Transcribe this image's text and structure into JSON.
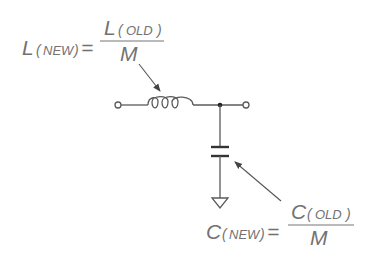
{
  "diagram": {
    "colors": {
      "background": "#ffffff",
      "text": "#727272",
      "wire": "#5a5a5a",
      "junction": "#222222"
    },
    "inductor_equation": {
      "lhs_symbol": "L",
      "lhs_subscript": "NEW",
      "equals": "=",
      "numerator_symbol": "L",
      "numerator_subscript": "OLD",
      "denominator": "M",
      "paren_open": "(",
      "paren_close": ")"
    },
    "capacitor_equation": {
      "lhs_symbol": "C",
      "lhs_subscript": "NEW",
      "equals": "=",
      "numerator_symbol": "C",
      "numerator_subscript": "OLD",
      "denominator": "M",
      "paren_open": "(",
      "paren_close": ")"
    },
    "circuit": {
      "components": [
        "input-terminal",
        "series-inductor",
        "junction",
        "output-terminal",
        "shunt-capacitor",
        "ground"
      ]
    }
  }
}
